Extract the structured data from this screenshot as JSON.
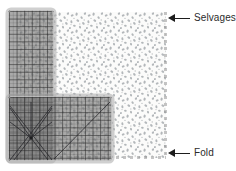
{
  "diagram": {
    "background_color": "#ffffff"
  },
  "fabric": {
    "name": "fabric-piece",
    "base_color": "#fbfbfa",
    "print_color": "#9aa0a4",
    "print_description": "scattered small gray motif print",
    "edges": {
      "right_edge_name": "selvage-edge",
      "bottom_edge_name": "fold-edge",
      "edge_style": "dashed"
    }
  },
  "ruler": {
    "name": "L-shaped quilting ruler",
    "body_color": "#767676",
    "grid_line_color": "#2d2d2d",
    "frame_color": "#b0b0b0",
    "shape": "L",
    "markings": "1-inch grid with 1/4-inch subgrid and 45/60/30 degree angle lines"
  },
  "callouts": [
    {
      "id": "selvages",
      "label": "Selvages",
      "arrow_direction": "left",
      "points_to": "fabric-right-edge"
    },
    {
      "id": "fold",
      "label": "Fold",
      "arrow_direction": "left",
      "points_to": "fabric-bottom-edge"
    }
  ]
}
